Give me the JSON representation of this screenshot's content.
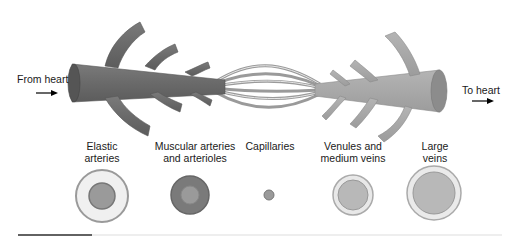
{
  "diagram": {
    "flow_labels": {
      "from_heart": "From heart",
      "to_heart": "To heart"
    },
    "vessel_types": [
      {
        "line1": "Elastic",
        "line2": "arteries"
      },
      {
        "line1": "Muscular arteries",
        "line2": "and arterioles"
      },
      {
        "line1": "Capillaries",
        "line2": ""
      },
      {
        "line1": "Venules and",
        "line2": "medium veins"
      },
      {
        "line1": "Large",
        "line2": "veins"
      }
    ],
    "colors": {
      "artery": "#6e6e6e",
      "vein": "#a8a8a8",
      "capillary": "#9a9a9a"
    }
  }
}
